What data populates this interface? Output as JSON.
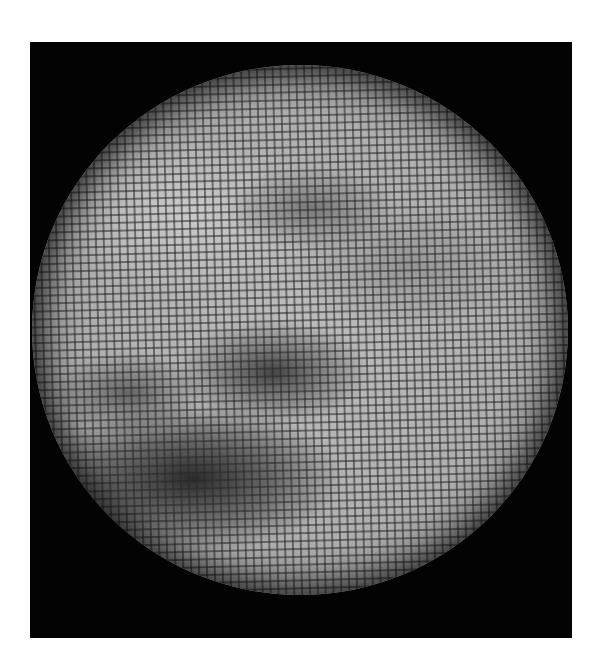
{
  "image": {
    "subject": "planet-disk",
    "description": "Grayscale planetary disk viewed through a dot-grid pattern, set in a black square frame on a white background",
    "colors": {
      "page_background": "#ffffff",
      "frame_background": "#030303",
      "disk_light": "#bdbdbd",
      "disk_dark_feature": "#1e1e1e"
    },
    "features": [
      {
        "name": "dark-streak-lower-left",
        "position": "lower-left of disk"
      },
      {
        "name": "faint-dark-patch-upper-center",
        "position": "upper-center of disk"
      },
      {
        "name": "bright-region-upper-left",
        "position": "upper-left of disk"
      }
    ]
  }
}
